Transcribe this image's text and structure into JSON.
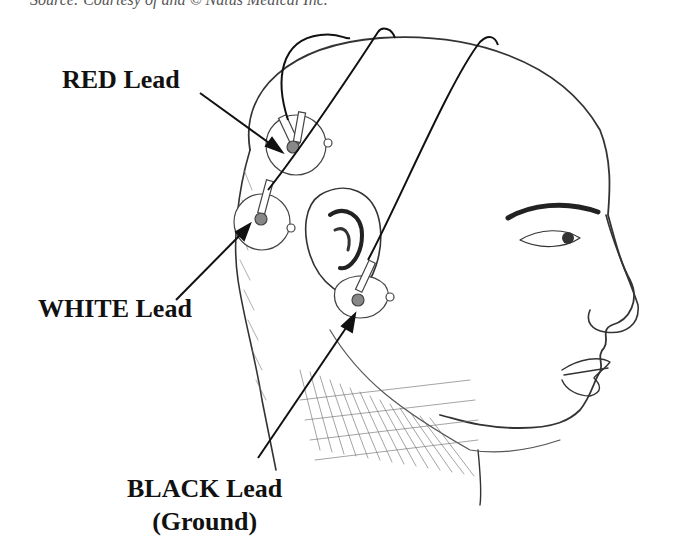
{
  "caption": "Source: Courtesy of and © Natus Medical Inc.",
  "labels": {
    "red": "RED Lead",
    "white": "WHITE Lead",
    "black_line1": "BLACK Lead",
    "black_line2": "(Ground)"
  },
  "figure": {
    "electrodes": [
      "red-electrode",
      "white-electrode",
      "black-electrode-earlobe"
    ]
  }
}
